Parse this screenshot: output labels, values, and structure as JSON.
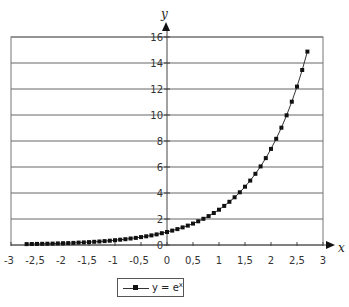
{
  "chart_data": {
    "type": "line",
    "title": "",
    "xlabel": "x",
    "ylabel": "y",
    "xlim": [
      -3,
      3
    ],
    "ylim": [
      0,
      16
    ],
    "x_ticks": [
      "-3",
      "-2,5",
      "-2",
      "-1,5",
      "-1",
      "-0,5",
      "0",
      "0,5",
      "1",
      "1,5",
      "2",
      "2,5",
      "3"
    ],
    "y_ticks": [
      "0",
      "2",
      "4",
      "6",
      "8",
      "10",
      "12",
      "14",
      "16"
    ],
    "grid": {
      "horizontal": true,
      "vertical": false
    },
    "legend_position": "bottom",
    "series": [
      {
        "name": "y = e^x",
        "marker": "square",
        "color": "#111111",
        "x": [
          -2.7,
          -2.6,
          -2.5,
          -2.4,
          -2.3,
          -2.2,
          -2.1,
          -2.0,
          -1.9,
          -1.8,
          -1.7,
          -1.6,
          -1.5,
          -1.4,
          -1.3,
          -1.2,
          -1.1,
          -1.0,
          -0.9,
          -0.8,
          -0.7,
          -0.6,
          -0.5,
          -0.4,
          -0.3,
          -0.2,
          -0.1,
          0.0,
          0.1,
          0.2,
          0.3,
          0.4,
          0.5,
          0.6,
          0.7,
          0.8,
          0.9,
          1.0,
          1.1,
          1.2,
          1.3,
          1.4,
          1.5,
          1.6,
          1.7,
          1.8,
          1.9,
          2.0,
          2.1,
          2.2,
          2.3,
          2.4,
          2.5,
          2.6,
          2.7
        ],
        "values": [
          0.067,
          0.074,
          0.082,
          0.091,
          0.1,
          0.111,
          0.122,
          0.135,
          0.15,
          0.165,
          0.183,
          0.202,
          0.223,
          0.247,
          0.273,
          0.301,
          0.333,
          0.368,
          0.407,
          0.449,
          0.497,
          0.549,
          0.607,
          0.67,
          0.741,
          0.819,
          0.905,
          1.0,
          1.105,
          1.221,
          1.35,
          1.492,
          1.649,
          1.822,
          2.014,
          2.226,
          2.46,
          2.718,
          3.004,
          3.32,
          3.669,
          4.055,
          4.482,
          4.953,
          5.474,
          6.05,
          6.686,
          7.389,
          8.166,
          9.025,
          9.974,
          11.023,
          12.182,
          13.464,
          14.88
        ]
      }
    ]
  },
  "axes": {
    "x_name": "x",
    "y_name": "y"
  },
  "legend": {
    "label_base": "y = e",
    "label_sup": "x"
  }
}
